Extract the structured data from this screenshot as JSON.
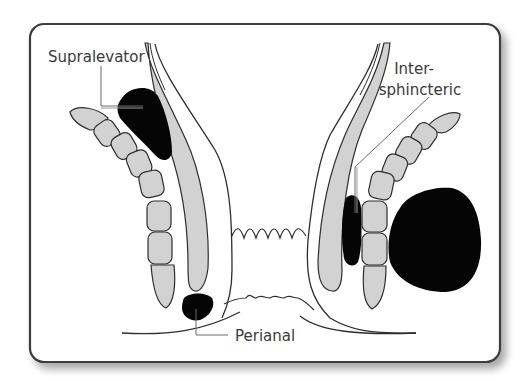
{
  "figure": {
    "labels": {
      "supralevator": "Supralevator",
      "intersphincteric_line1": "Inter-",
      "intersphincteric_line2": "sphincteric",
      "perianal": "Perianal"
    },
    "colors": {
      "frame_stroke": "#3c3c3c",
      "abscess_fill": "#050505",
      "muscle_fill": "#d2d2d2",
      "outline": "#2e2e2e",
      "label_text": "#3a3a3a",
      "background": "#ffffff"
    }
  }
}
